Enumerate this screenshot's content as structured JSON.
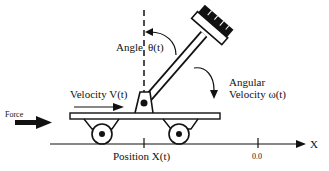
{
  "diagram": {
    "labels": {
      "angle": "Angle θ(t)",
      "angle_word": "Angle",
      "angle_symbol": "θ(t)",
      "angular_velocity_line1": "Angular",
      "angular_velocity_line2": "Velocity  ω(t)",
      "velocity": "Velocity V(t)",
      "force": "Force",
      "position": "Position X(t)",
      "origin": "0.0",
      "axis": "X"
    },
    "colors": {
      "ink": "#111111",
      "background": "#ffffff"
    }
  }
}
